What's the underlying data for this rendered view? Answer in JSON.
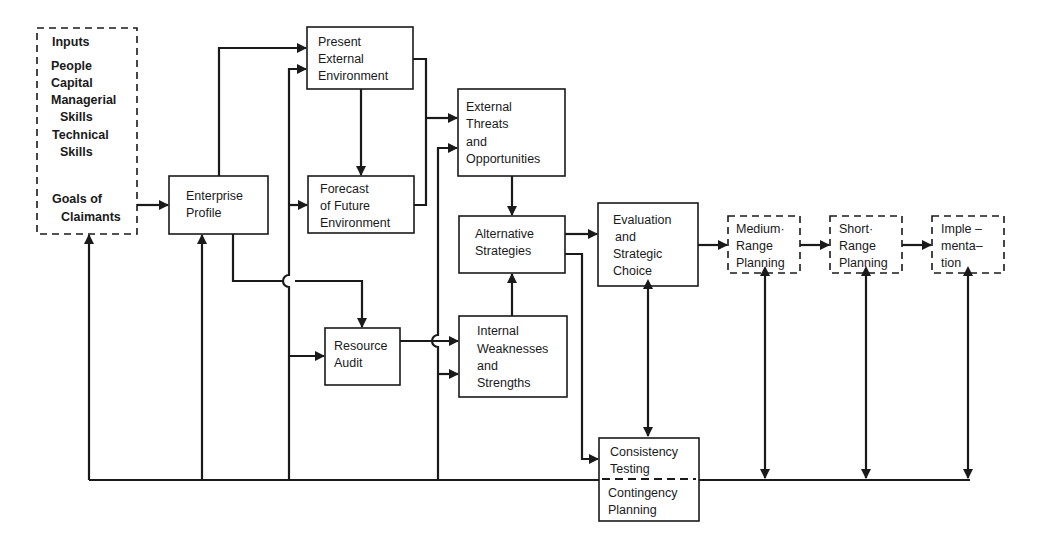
{
  "diagram": {
    "stroke_color": "#1a1a1a",
    "background": "#ffffff",
    "nodes": {
      "inputs": {
        "title": "Inputs",
        "items": [
          "People",
          "Capital",
          "Managerial",
          "  Skills",
          "Technical",
          "  Skills"
        ],
        "goals": [
          "Goals of",
          "  Claimants"
        ],
        "style": "dashed"
      },
      "enterprise_profile": {
        "lines": [
          "Enterprise",
          "Profile"
        ]
      },
      "present_external": {
        "lines": [
          "Present",
          "External",
          "Environment"
        ]
      },
      "forecast_future": {
        "lines": [
          "Forecast",
          "of Future",
          "Environment"
        ]
      },
      "external_threats": {
        "lines": [
          "External",
          "Threats",
          "and",
          "Opportunities"
        ]
      },
      "alternative_strategies": {
        "lines": [
          "Alternative",
          "Strategies"
        ]
      },
      "resource_audit": {
        "lines": [
          "Resource",
          "Audit"
        ]
      },
      "internal_weaknesses": {
        "lines": [
          "Internal",
          "Weaknesses",
          "and",
          "Strengths"
        ]
      },
      "evaluation": {
        "lines": [
          "Evaluation",
          "and",
          "Strategic",
          "Choice"
        ]
      },
      "consistency": {
        "top": [
          "Consistency",
          "Testing"
        ],
        "bottom": [
          "Contingency",
          "Planning"
        ]
      },
      "medium_range": {
        "lines": [
          "Medium·",
          "Range",
          "Planning"
        ],
        "style": "dashed"
      },
      "short_range": {
        "lines": [
          "Short·",
          "Range",
          "Planning"
        ],
        "style": "dashed"
      },
      "implementation": {
        "lines": [
          "Imple –",
          "menta–",
          "tion"
        ],
        "style": "dashed"
      }
    },
    "edges": [
      [
        "Inputs",
        "Enterprise Profile"
      ],
      [
        "Enterprise Profile",
        "Present External Environment"
      ],
      [
        "Enterprise Profile",
        "Resource Audit"
      ],
      [
        "Present External Environment",
        "Forecast of Future Environment"
      ],
      [
        "Present External Environment",
        "External Threats and Opportunities"
      ],
      [
        "Forecast of Future Environment",
        "External Threats and Opportunities"
      ],
      [
        "External Threats and Opportunities",
        "Alternative Strategies"
      ],
      [
        "Resource Audit",
        "Internal Weaknesses and Strengths"
      ],
      [
        "Internal Weaknesses and Strengths",
        "Alternative Strategies"
      ],
      [
        "Alternative Strategies",
        "Evaluation and Strategic Choice"
      ],
      [
        "Alternative Strategies",
        "Consistency Testing"
      ],
      [
        "Evaluation and Strategic Choice",
        "Consistency Testing"
      ],
      [
        "Evaluation and Strategic Choice",
        "Medium-Range Planning"
      ],
      [
        "Medium-Range Planning",
        "Short-Range Planning"
      ],
      [
        "Short-Range Planning",
        "Implementation"
      ],
      [
        "Feedback line",
        "Inputs"
      ],
      [
        "Feedback line",
        "Enterprise Profile"
      ],
      [
        "Feedback line",
        "Present External / Forecast / Resource Audit"
      ],
      [
        "Feedback line",
        "External Threats / Internal Weaknesses"
      ],
      [
        "Planning / Implementation",
        "Feedback line (bidirectional)"
      ]
    ]
  }
}
